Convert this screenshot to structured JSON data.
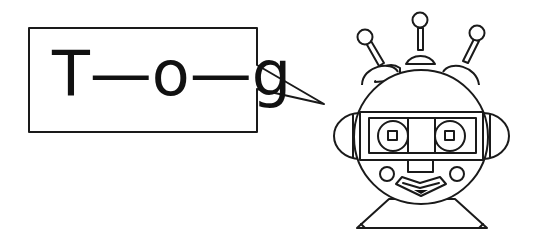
{
  "speech_bubble": {
    "text": "T—o—g"
  },
  "figure": {
    "parts": [
      "head",
      "three-antennae",
      "visor",
      "two-eyes",
      "ears",
      "nose",
      "cheeks",
      "mouth",
      "base"
    ]
  },
  "colors": {
    "stroke": "#1a1a1a",
    "fill": "#ffffff",
    "mouth_accent": "#111111"
  }
}
